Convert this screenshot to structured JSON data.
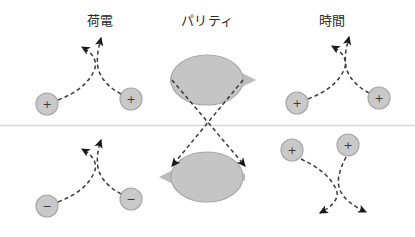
{
  "figure": {
    "title_columns": {
      "charge": "荷電",
      "parity": "パリティ",
      "time": "時間"
    },
    "divider": {
      "name": "horizontal-divider",
      "color": "#d8d8d8"
    },
    "colors": {
      "particle_fill": "#c9c9c9",
      "particle_stroke": "#a8a8a8",
      "ellipse_fill": "#c5c5c5",
      "ellipse_stroke": "#a9a9a9",
      "spin_arrow": "#bcbcbc",
      "trajectory": "#3a3a3a",
      "arrowhead": "#1a1a1a",
      "background": "#ffffff",
      "label_text": "#2b2b2b"
    },
    "panels": [
      {
        "id": "charge-top",
        "column": "charge",
        "row": "top",
        "particles": [
          {
            "label": "+",
            "x": 47,
            "y": 104
          },
          {
            "label": "+",
            "x": 131,
            "y": 99
          }
        ],
        "arrow_count": 2
      },
      {
        "id": "charge-bottom",
        "column": "charge",
        "row": "bottom",
        "particles": [
          {
            "label": "−",
            "x": 47,
            "y": 206
          },
          {
            "label": "−",
            "x": 131,
            "y": 199
          }
        ],
        "arrow_count": 2
      },
      {
        "id": "parity-top",
        "column": "parity",
        "row": "top",
        "spin_direction": "right",
        "ellipse": {
          "cx": 207,
          "cy": 80,
          "rx": 36,
          "ry": 25
        }
      },
      {
        "id": "parity-bottom",
        "column": "parity",
        "row": "bottom",
        "spin_direction": "left",
        "ellipse": {
          "cx": 207,
          "cy": 177,
          "rx": 36,
          "ry": 25
        }
      },
      {
        "id": "time-top",
        "column": "time",
        "row": "top",
        "particles": [
          {
            "label": "+",
            "x": 297,
            "y": 103
          },
          {
            "label": "+",
            "x": 379,
            "y": 98
          }
        ],
        "arrow_count": 2
      },
      {
        "id": "time-bottom",
        "column": "time",
        "row": "bottom",
        "particles": [
          {
            "label": "+",
            "x": 292,
            "y": 150
          },
          {
            "label": "+",
            "x": 348,
            "y": 145
          }
        ],
        "arrow_count": 2
      }
    ],
    "parity_transition_arrows": [
      {
        "name": "parity-arrow-left-to-right",
        "from": "top-left",
        "to": "bottom-right"
      },
      {
        "name": "parity-arrow-right-to-left",
        "from": "top-right",
        "to": "bottom-left"
      }
    ]
  }
}
